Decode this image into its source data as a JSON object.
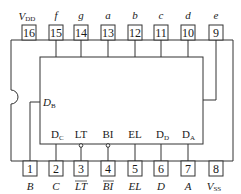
{
  "top_pins": [
    {
      "num": "16",
      "label": "V",
      "sub": "DD"
    },
    {
      "num": "15",
      "label": "f",
      "sub": ""
    },
    {
      "num": "14",
      "label": "g",
      "sub": ""
    },
    {
      "num": "13",
      "label": "a",
      "sub": ""
    },
    {
      "num": "12",
      "label": "b",
      "sub": ""
    },
    {
      "num": "11",
      "label": "c",
      "sub": ""
    },
    {
      "num": "10",
      "label": "d",
      "sub": ""
    },
    {
      "num": "9",
      "label": "e",
      "sub": ""
    }
  ],
  "bottom_pins": [
    {
      "num": "1",
      "label": "B",
      "sub": ""
    },
    {
      "num": "2",
      "label": "C",
      "sub": ""
    },
    {
      "num": "3",
      "label": "LT",
      "sub": "",
      "overbar": true
    },
    {
      "num": "4",
      "label": "BI",
      "sub": "",
      "overbar": true
    },
    {
      "num": "5",
      "label": "EL",
      "sub": ""
    },
    {
      "num": "6",
      "label": "D",
      "sub": ""
    },
    {
      "num": "7",
      "label": "A",
      "sub": ""
    },
    {
      "num": "8",
      "label": "V",
      "sub": "SS"
    }
  ],
  "inner_labels": {
    "db": {
      "main": "D",
      "sub": "B"
    },
    "dc": {
      "main": "D",
      "sub": "C"
    },
    "lt": "LT",
    "bi": "BI",
    "el": "EL",
    "dd": {
      "main": "D",
      "sub": "D"
    },
    "da": {
      "main": "D",
      "sub": "A"
    }
  }
}
